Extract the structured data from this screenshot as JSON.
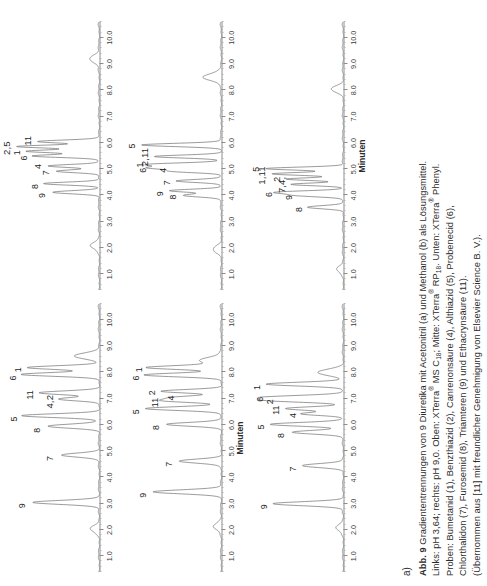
{
  "figure": {
    "panel_letter": "a)",
    "axis_title": "Minuten",
    "caption": {
      "lines": [
        {
          "id": "l1",
          "bold": "Abb. 9",
          "text": " Gradiententrennungen von 9 Diuretika mit Acetonitril (a) und Methanol (b) als Lösungsmittel."
        },
        {
          "id": "l2",
          "text": "Links: pH 3,64; rechts: pH 9,0. Oben: XTerra® MS C18; Mitte: XTerra® RP18. Unten: XTerra® Phenyl."
        },
        {
          "id": "l3",
          "text": "Proben: Bumetanid (1), Benzthiazid (2), Canrenonsäure (4), Althiazid (5), Probenecid (6),"
        },
        {
          "id": "l4",
          "text": "Chlorthalidon (7), Furosemid (8), Triamteren (9) und Ethacrynsäure (11)."
        },
        {
          "id": "l5",
          "text": "(Übernommen aus [11] mit freundlicher Genehmigung von Elsevier Science B. V.)."
        }
      ]
    }
  },
  "chart_data": [
    {
      "id": "top-left",
      "type": "line",
      "title": "Oben links: XTerra MS C18, pH 3,64 (Acetonitril)",
      "xlabel": "Minuten",
      "ylabel": "",
      "xlim": [
        0.4,
        10.6
      ],
      "ylim": [
        0,
        1
      ],
      "xticks": [
        1.0,
        2.0,
        3.0,
        4.0,
        5.0,
        6.0,
        7.0,
        8.0,
        9.0,
        10.0
      ],
      "xticklabels": [
        "1.0",
        "2.0",
        "3.0",
        "4.0",
        "5.0",
        "6.0",
        "7.0",
        "8.0",
        "9.0",
        "10.0"
      ],
      "grid": false,
      "peaks": [
        {
          "label": "9",
          "x": 3.05,
          "height": 0.8,
          "width": 0.075,
          "lx": 2.92,
          "ly": 0.93
        },
        {
          "label": "7",
          "x": 4.85,
          "height": 0.46,
          "width": 0.075,
          "lx": 4.72,
          "ly": 0.6
        },
        {
          "label": "8",
          "x": 5.95,
          "height": 0.62,
          "width": 0.075,
          "lx": 5.8,
          "ly": 0.75
        },
        {
          "label": "5",
          "x": 6.35,
          "height": 0.93,
          "width": 0.07,
          "lx": 6.22,
          "ly": 1.03
        },
        {
          "label": "4,2",
          "x": 6.98,
          "height": 0.48,
          "width": 0.065,
          "lx": 6.88,
          "ly": 0.6
        },
        {
          "label": "11",
          "x": 7.22,
          "height": 0.72,
          "width": 0.07,
          "lx": 7.14,
          "ly": 0.84
        },
        {
          "label": "6",
          "x": 7.92,
          "height": 0.93,
          "width": 0.07,
          "lx": 7.78,
          "ly": 1.04
        },
        {
          "label": "1",
          "x": 8.18,
          "height": 0.86,
          "width": 0.07,
          "lx": 8.1,
          "ly": 0.98
        },
        {
          "label": "",
          "x": 8.62,
          "height": 0.3,
          "width": 0.11,
          "lx": 0,
          "ly": 0
        },
        {
          "label": "",
          "x": 2.05,
          "height": 0.1,
          "width": 0.13,
          "lx": 0,
          "ly": 0
        }
      ]
    },
    {
      "id": "mid-left",
      "type": "line",
      "title": "Mitte links: XTerra RP18, pH 3,64 (Acetonitril)",
      "xlabel": "Minuten",
      "xlim": [
        0.4,
        10.6
      ],
      "ylim": [
        0,
        1
      ],
      "xticks": [
        1.0,
        2.0,
        3.0,
        4.0,
        5.0,
        6.0,
        7.0,
        8.0,
        9.0,
        10.0
      ],
      "xticklabels": [
        "1.0",
        "2.0",
        "3.0",
        "4.0",
        "5.0",
        "6.0",
        "7.0",
        "8.0",
        "9.0",
        "10.0"
      ],
      "grid": false,
      "peaks": [
        {
          "label": "9",
          "x": 3.45,
          "height": 0.82,
          "width": 0.075,
          "lx": 3.32,
          "ly": 0.95
        },
        {
          "label": "7",
          "x": 4.62,
          "height": 0.5,
          "width": 0.075,
          "lx": 4.5,
          "ly": 0.63
        },
        {
          "label": "8",
          "x": 6.02,
          "height": 0.66,
          "width": 0.07,
          "lx": 5.9,
          "ly": 0.79
        },
        {
          "label": "5",
          "x": 6.62,
          "height": 0.92,
          "width": 0.07,
          "lx": 6.5,
          "ly": 1.03
        },
        {
          "label": "11",
          "x": 6.92,
          "height": 0.68,
          "width": 0.065,
          "lx": 6.85,
          "ly": 0.8
        },
        {
          "label": "4",
          "x": 7.05,
          "height": 0.5,
          "width": 0.06,
          "lx": 7.02,
          "ly": 0.61
        },
        {
          "label": "2",
          "x": 7.28,
          "height": 0.72,
          "width": 0.065,
          "lx": 7.22,
          "ly": 0.84
        },
        {
          "label": "6",
          "x": 7.9,
          "height": 0.92,
          "width": 0.07,
          "lx": 7.78,
          "ly": 1.03
        },
        {
          "label": "1",
          "x": 8.18,
          "height": 0.88,
          "width": 0.07,
          "lx": 8.1,
          "ly": 0.99
        },
        {
          "label": "",
          "x": 8.45,
          "height": 0.26,
          "width": 0.12,
          "lx": 0,
          "ly": 0
        },
        {
          "label": "",
          "x": 2.15,
          "height": 0.09,
          "width": 0.13,
          "lx": 0,
          "ly": 0
        }
      ]
    },
    {
      "id": "bot-left",
      "type": "line",
      "title": "Unten links: XTerra Phenyl, pH 3,64 (Acetonitril)",
      "xlabel": "Minuten",
      "xlim": [
        0.4,
        10.6
      ],
      "ylim": [
        0,
        1
      ],
      "xticks": [
        1.0,
        2.0,
        3.0,
        4.0,
        5.0,
        6.0,
        7.0,
        8.0,
        9.0,
        10.0
      ],
      "xticklabels": [
        "1.0",
        "2.0",
        "3.0",
        "4.0",
        "5.0",
        "6.0",
        "7.0",
        "8.0",
        "9.0",
        "10.0"
      ],
      "grid": false,
      "peaks": [
        {
          "label": "9",
          "x": 3.0,
          "height": 0.84,
          "width": 0.075,
          "lx": 2.88,
          "ly": 0.96
        },
        {
          "label": "7",
          "x": 4.45,
          "height": 0.48,
          "width": 0.075,
          "lx": 4.32,
          "ly": 0.61
        },
        {
          "label": "8",
          "x": 5.72,
          "height": 0.62,
          "width": 0.07,
          "lx": 5.6,
          "ly": 0.75
        },
        {
          "label": "5",
          "x": 6.02,
          "height": 0.88,
          "width": 0.07,
          "lx": 5.92,
          "ly": 0.99
        },
        {
          "label": "4",
          "x": 6.42,
          "height": 0.5,
          "width": 0.06,
          "lx": 6.36,
          "ly": 0.61
        },
        {
          "label": "11",
          "x": 6.62,
          "height": 0.7,
          "width": 0.065,
          "lx": 6.56,
          "ly": 0.81
        },
        {
          "label": "2",
          "x": 6.92,
          "height": 0.76,
          "width": 0.065,
          "lx": 6.88,
          "ly": 0.88
        },
        {
          "label": "6",
          "x": 7.05,
          "height": 0.9,
          "width": 0.07,
          "lx": 6.98,
          "ly": 1.01
        },
        {
          "label": "1",
          "x": 7.55,
          "height": 0.93,
          "width": 0.07,
          "lx": 7.42,
          "ly": 1.04
        },
        {
          "label": "",
          "x": 8.0,
          "height": 0.3,
          "width": 0.12,
          "lx": 0,
          "ly": 0
        },
        {
          "label": "",
          "x": 2.1,
          "height": 0.08,
          "width": 0.13,
          "lx": 0,
          "ly": 0
        }
      ]
    },
    {
      "id": "top-right",
      "type": "line",
      "title": "Oben rechts: XTerra MS C18, pH 9,0 (Acetonitril)",
      "xlabel": "Minuten",
      "xlim": [
        0.4,
        10.6
      ],
      "ylim": [
        0,
        1
      ],
      "xticks": [
        1.0,
        2.0,
        3.0,
        4.0,
        5.0,
        6.0,
        7.0,
        8.0,
        9.0,
        10.0
      ],
      "xticklabels": [
        "1.0",
        "2.0",
        "3.0",
        "4.0",
        "5.0",
        "6.0",
        "7.0",
        "8.0",
        "9.0",
        "10.0"
      ],
      "grid": false,
      "peaks": [
        {
          "label": "9",
          "x": 4.12,
          "height": 0.56,
          "width": 0.06,
          "lx": 4.0,
          "ly": 0.69
        },
        {
          "label": "8",
          "x": 4.45,
          "height": 0.66,
          "width": 0.055,
          "lx": 4.34,
          "ly": 0.78
        },
        {
          "label": "7",
          "x": 4.92,
          "height": 0.52,
          "width": 0.055,
          "lx": 4.86,
          "ly": 0.64
        },
        {
          "label": "4",
          "x": 5.12,
          "height": 0.62,
          "width": 0.055,
          "lx": 5.1,
          "ly": 0.74
        },
        {
          "label": "6",
          "x": 5.5,
          "height": 0.8,
          "width": 0.055,
          "lx": 5.42,
          "ly": 0.91
        },
        {
          "label": "1",
          "x": 5.68,
          "height": 0.88,
          "width": 0.055,
          "lx": 5.62,
          "ly": 0.99
        },
        {
          "label": "2,5",
          "x": 5.86,
          "height": 0.99,
          "width": 0.055,
          "lx": 5.8,
          "ly": 1.11
        },
        {
          "label": "11",
          "x": 6.05,
          "height": 0.74,
          "width": 0.055,
          "lx": 6.08,
          "ly": 0.86
        },
        {
          "label": "",
          "x": 9.2,
          "height": 0.12,
          "width": 0.13,
          "lx": 0,
          "ly": 0
        },
        {
          "label": "",
          "x": 2.1,
          "height": 0.1,
          "width": 0.13,
          "lx": 0,
          "ly": 0
        }
      ]
    },
    {
      "id": "mid-right",
      "type": "line",
      "title": "Mitte rechts: XTerra RP18, pH 9,0 (Acetonitril)",
      "xlabel": "Minuten",
      "xlim": [
        0.4,
        10.6
      ],
      "ylim": [
        0,
        1
      ],
      "xticks": [
        1.0,
        2.0,
        3.0,
        4.0,
        5.0,
        6.0,
        7.0,
        8.0,
        9.0,
        10.0
      ],
      "xticklabels": [
        "1.0",
        "2.0",
        "3.0",
        "4.0",
        "5.0",
        "6.0",
        "7.0",
        "8.0",
        "9.0",
        "10.0"
      ],
      "grid": false,
      "peaks": [
        {
          "label": "8",
          "x": 4.0,
          "height": 0.46,
          "width": 0.06,
          "lx": 3.94,
          "ly": 0.58
        },
        {
          "label": "9",
          "x": 4.18,
          "height": 0.62,
          "width": 0.055,
          "lx": 4.06,
          "ly": 0.74
        },
        {
          "label": "7",
          "x": 4.55,
          "height": 0.54,
          "width": 0.055,
          "lx": 4.48,
          "ly": 0.66
        },
        {
          "label": "4",
          "x": 4.92,
          "height": 0.58,
          "width": 0.055,
          "lx": 4.96,
          "ly": 0.7
        },
        {
          "label": "6",
          "x": 5.05,
          "height": 0.82,
          "width": 0.055,
          "lx": 4.96,
          "ly": 0.94
        },
        {
          "label": "1",
          "x": 5.18,
          "height": 0.86,
          "width": 0.055,
          "lx": 5.16,
          "ly": 0.98
        },
        {
          "label": "2,11",
          "x": 5.48,
          "height": 0.8,
          "width": 0.055,
          "lx": 5.46,
          "ly": 0.92
        },
        {
          "label": "5",
          "x": 5.92,
          "height": 0.96,
          "width": 0.06,
          "lx": 5.88,
          "ly": 1.08
        },
        {
          "label": "",
          "x": 8.5,
          "height": 0.22,
          "width": 0.13,
          "lx": 0,
          "ly": 0
        },
        {
          "label": "",
          "x": 1.95,
          "height": 0.09,
          "width": 0.13,
          "lx": 0,
          "ly": 0
        }
      ]
    },
    {
      "id": "bot-right",
      "type": "line",
      "title": "Unten rechts: XTerra Phenyl, pH 9,0 (Acetonitril)",
      "xlabel": "Minuten",
      "xlim": [
        0.4,
        10.6
      ],
      "ylim": [
        0,
        1
      ],
      "xticks": [
        1.0,
        2.0,
        3.0,
        4.0,
        5.0,
        6.0,
        7.0,
        8.0,
        9.0,
        10.0
      ],
      "xticklabels": [
        "1.0",
        "2.0",
        "3.0",
        "4.0",
        "5.0",
        "6.0",
        "7.0",
        "8.0",
        "9.0",
        "10.0"
      ],
      "grid": false,
      "peaks": [
        {
          "label": "8",
          "x": 3.55,
          "height": 0.42,
          "width": 0.06,
          "lx": 3.46,
          "ly": 0.54
        },
        {
          "label": "9",
          "x": 4.0,
          "height": 0.54,
          "width": 0.055,
          "lx": 3.92,
          "ly": 0.66
        },
        {
          "label": "6",
          "x": 4.12,
          "height": 0.78,
          "width": 0.055,
          "lx": 4.04,
          "ly": 0.9
        },
        {
          "label": "7,4,",
          "x": 4.42,
          "height": 0.62,
          "width": 0.05,
          "lx": 4.4,
          "ly": 0.74
        },
        {
          "label": "2",
          "x": 4.62,
          "height": 0.68,
          "width": 0.05,
          "lx": 4.62,
          "ly": 0.8
        },
        {
          "label": "1,11",
          "x": 4.82,
          "height": 0.86,
          "width": 0.055,
          "lx": 4.76,
          "ly": 0.98
        },
        {
          "label": "5",
          "x": 5.02,
          "height": 0.93,
          "width": 0.055,
          "lx": 5.0,
          "ly": 1.06
        },
        {
          "label": "",
          "x": 8.05,
          "height": 0.14,
          "width": 0.12,
          "lx": 0,
          "ly": 0
        },
        {
          "label": "",
          "x": 1.2,
          "height": 0.07,
          "width": 0.13,
          "lx": 0,
          "ly": 0
        }
      ]
    }
  ]
}
